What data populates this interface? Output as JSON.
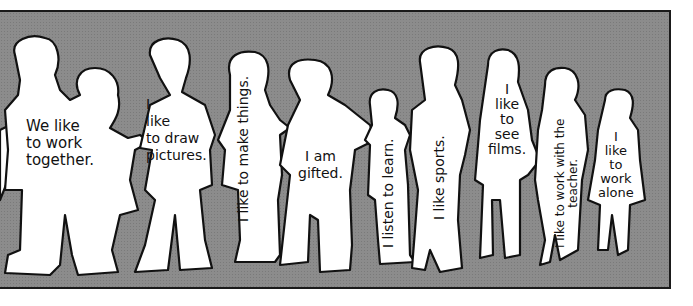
{
  "illustration": {
    "background_color": "#8c8c8c",
    "figure_color": "#ffffff",
    "outline_color": "#111111",
    "figures": [
      {
        "id": "pair-together",
        "label": "We like\nto work\ntogether.",
        "orientation": "horizontal"
      },
      {
        "id": "draw",
        "label": "I\nlike\nto draw\npictures.",
        "orientation": "horizontal"
      },
      {
        "id": "make",
        "label": "I like to make things.",
        "orientation": "vertical"
      },
      {
        "id": "gifted",
        "label": "I am\ngifted.",
        "orientation": "horizontal"
      },
      {
        "id": "listen",
        "label": "I listen to learn.",
        "orientation": "vertical"
      },
      {
        "id": "sports",
        "label": "I like sports.",
        "orientation": "vertical"
      },
      {
        "id": "films",
        "label": "I\nlike\nto\nsee\nfilms.",
        "orientation": "horizontal"
      },
      {
        "id": "teacher",
        "label": "I like to work with the\nteacher.",
        "orientation": "vertical"
      },
      {
        "id": "alone",
        "label": "I\nlike\nto\nwork\nalone",
        "orientation": "horizontal"
      }
    ]
  }
}
